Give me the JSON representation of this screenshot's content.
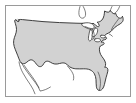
{
  "figure": {
    "kind": "map-thumbnail",
    "caption": "",
    "projection_hint": "simple conic, north up",
    "colors": {
      "background": "#ffffff",
      "frame_border": "#9a9a9a",
      "land_fill": "#d2d2d2",
      "land_stroke": "#2b2b2b",
      "neighbor_stroke": "#3a3a3a",
      "water_fill": "#ffffff"
    },
    "frame": {
      "visible": true,
      "x": 5,
      "y": 5,
      "width": 126,
      "height": 92,
      "border_width": 1
    }
  },
  "map": {
    "regions": [
      {
        "name": "contiguous-united-states",
        "label": "Contiguous United States",
        "style": "filled",
        "fill": "#d2d2d2",
        "stroke": "#2b2b2b"
      },
      {
        "name": "baja-california",
        "label": "Baja California Peninsula",
        "style": "outline",
        "fill": "none",
        "stroke": "#4a4a4a"
      },
      {
        "name": "southern-canada",
        "label": "Southern Canada",
        "style": "outline",
        "fill": "none",
        "stroke": "#3a3a3a"
      },
      {
        "name": "great-lakes",
        "label": "Great Lakes",
        "style": "water",
        "fill": "#ffffff",
        "stroke": "#3a3a3a"
      },
      {
        "name": "gulf-of-mexico-coastline",
        "label": "Gulf Coast",
        "style": "coastline",
        "fill": "none",
        "stroke": "#4a4a4a"
      }
    ],
    "landmarks": [
      {
        "name": "puget-sound",
        "label": "Puget Sound"
      },
      {
        "name": "lake-superior",
        "label": "Lake Superior"
      },
      {
        "name": "lake-michigan",
        "label": "Lake Michigan"
      },
      {
        "name": "lake-huron",
        "label": "Lake Huron"
      },
      {
        "name": "lake-erie",
        "label": "Lake Erie"
      },
      {
        "name": "lake-ontario",
        "label": "Lake Ontario"
      },
      {
        "name": "michigan-upper-peninsula",
        "label": "Upper Peninsula"
      },
      {
        "name": "maine",
        "label": "Maine"
      },
      {
        "name": "cape-cod",
        "label": "Cape Cod"
      },
      {
        "name": "florida-peninsula",
        "label": "Florida"
      },
      {
        "name": "texas-gulf-coast",
        "label": "Texas Gulf Coast"
      },
      {
        "name": "california-coast",
        "label": "California Coast"
      }
    ]
  }
}
